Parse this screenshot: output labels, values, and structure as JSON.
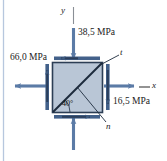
{
  "figure": {
    "type": "stress-element-diagram",
    "colors": {
      "element_fill": "#b9c6d6",
      "element_stroke": "#2c3e55",
      "arrow": "#5b7ba6",
      "edge_band": "#4a6party",
      "text": "#1a1a1a",
      "left_rule": "#b7c7de"
    }
  },
  "axes": {
    "y_label": "y",
    "x_label": "x"
  },
  "planes": {
    "t_label": "t",
    "n_label": "n"
  },
  "angle": {
    "value": "40°"
  },
  "stresses": [
    {
      "name": "top-stress",
      "label": "38,5 MPa",
      "direction": "down"
    },
    {
      "name": "left-stress",
      "label": "66,0 MPa",
      "direction": "left"
    },
    {
      "name": "right-stress",
      "label": "16,5 MPa",
      "direction": "right"
    }
  ]
}
